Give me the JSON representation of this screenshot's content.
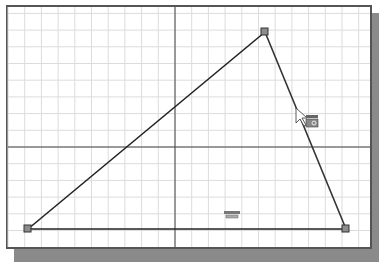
{
  "canvas": {
    "grid_spacing_px": 16.7,
    "axis_origin": {
      "x": 175,
      "y": 147
    },
    "colors": {
      "grid": "#dcdcdc",
      "axis": "#444444",
      "line": "#222222",
      "vertex_fill": "#8c8c8c",
      "frame": "#555555",
      "shadow": "#8a8a8a"
    }
  },
  "triangle": {
    "vertices": [
      {
        "name": "bottom-left",
        "x": 28,
        "y": 229
      },
      {
        "name": "top",
        "x": 265,
        "y": 32
      },
      {
        "name": "bottom-right",
        "x": 346,
        "y": 229
      }
    ]
  },
  "constraints": [
    {
      "name": "horizontal-constraint-icon",
      "x": 224,
      "y": 212
    },
    {
      "name": "line-constraint-cursor-icon",
      "x": 305,
      "y": 118
    }
  ]
}
